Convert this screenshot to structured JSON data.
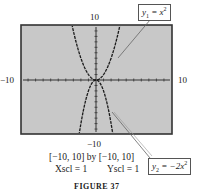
{
  "chart_data": {
    "type": "line",
    "title": "",
    "figure_label": "FIGURE 37",
    "window": {
      "xmin": -10,
      "xmax": 10,
      "ymin": -10,
      "ymax": 10,
      "xscl": 1,
      "yscl": 1
    },
    "xlim": [
      -10,
      10
    ],
    "ylim": [
      -10,
      10
    ],
    "grid": false,
    "series": [
      {
        "name": "y1 = x^2",
        "expression": "x^2",
        "x": [
          -3.16,
          -3,
          -2,
          -1,
          0,
          1,
          2,
          3,
          3.16
        ],
        "y": [
          10,
          9,
          4,
          1,
          0,
          1,
          4,
          9,
          10
        ]
      },
      {
        "name": "y2 = -2x^2",
        "expression": "-2x^2",
        "x": [
          -2.24,
          -2,
          -1,
          0,
          1,
          2,
          2.24
        ],
        "y": [
          -10,
          -8,
          -2,
          0,
          -2,
          -8,
          -10
        ]
      }
    ],
    "tick_labels": {
      "top": "10",
      "bottom": "−10",
      "left": "−10",
      "right": "10"
    },
    "annotations": [
      "y1 = x^2",
      "y2 = −2x^2"
    ]
  },
  "labels": {
    "ymax": "10",
    "ymin": "−10",
    "xmin": "−10",
    "xmax": "10"
  },
  "callouts": {
    "y1_var": "y",
    "y1_sub": "1",
    "y1_rhs": " = x",
    "y1_exp": "2",
    "y2_var": "y",
    "y2_sub": "2",
    "y2_rhs": " = −2x",
    "y2_exp": "2"
  },
  "caption": {
    "window": "[−10, 10] by [−10, 10]",
    "xscl": "Xscl = 1",
    "yscl": "Yscl = 1",
    "figure": "FIGURE 37"
  },
  "colors": {
    "screen": "#c8c8c8",
    "frame": "#333333",
    "curve": "#1a1a1a"
  }
}
